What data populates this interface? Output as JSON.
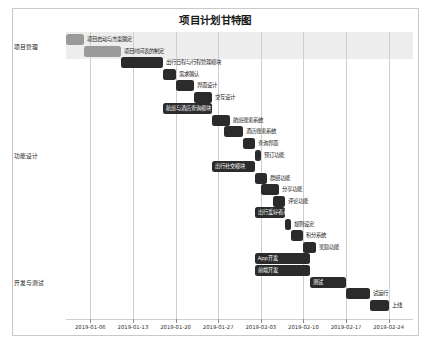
{
  "chart_data": {
    "type": "bar",
    "subtype": "gantt",
    "title": "项目计划甘特图",
    "xlabel": "",
    "ylabel": "",
    "grid": true,
    "legend": false,
    "x_axis": {
      "type": "date",
      "range": [
        "2019-01-02",
        "2019-02-28"
      ],
      "tick_labels": [
        "2019-01-06",
        "2019-01-13",
        "2019-01-20",
        "2019-01-27",
        "2019-02-03",
        "2019-02-10",
        "2019-02-17",
        "2019-02-24"
      ]
    },
    "categories": [
      {
        "label": "项目管理",
        "shaded": true
      },
      {
        "label": "功能设计",
        "shaded": false
      },
      {
        "label": "开发与测试",
        "shaded": false
      }
    ],
    "tasks": [
      {
        "name": "项目启动与方案确定",
        "category": "项目管理",
        "start": "2019-01-02",
        "end": "2019-01-05",
        "color": "#9a9a9a",
        "label_position": "right"
      },
      {
        "name": "项目时间表的制定",
        "category": "项目管理",
        "start": "2019-01-05",
        "end": "2019-01-11",
        "color": "#9a9a9a",
        "label_position": "right"
      },
      {
        "name": "出行日程与行程管理模块",
        "category": "功能设计",
        "start": "2019-01-11",
        "end": "2019-01-18",
        "color": "#2b2b2b",
        "label_position": "right"
      },
      {
        "name": "需求确认",
        "category": "功能设计",
        "start": "2019-01-18",
        "end": "2019-01-20",
        "color": "#2b2b2b",
        "label_position": "right"
      },
      {
        "name": "界面设计",
        "category": "功能设计",
        "start": "2019-01-20",
        "end": "2019-01-23",
        "color": "#2b2b2b",
        "label_position": "right"
      },
      {
        "name": "交互设计",
        "category": "功能设计",
        "start": "2019-01-23",
        "end": "2019-01-26",
        "color": "#2b2b2b",
        "label_position": "right"
      },
      {
        "name": "航班与酒店查询模块",
        "category": "功能设计",
        "start": "2019-01-18",
        "end": "2019-01-26",
        "color": "#2b2b2b",
        "label_position": "inside"
      },
      {
        "name": "航班搜索系统",
        "category": "功能设计",
        "start": "2019-01-26",
        "end": "2019-01-29",
        "color": "#2b2b2b",
        "label_position": "right"
      },
      {
        "name": "酒店搜索系统",
        "category": "功能设计",
        "start": "2019-01-28",
        "end": "2019-01-31",
        "color": "#2b2b2b",
        "label_position": "right"
      },
      {
        "name": "查询界面",
        "category": "功能设计",
        "start": "2019-01-31",
        "end": "2019-02-02",
        "color": "#2b2b2b",
        "label_position": "right"
      },
      {
        "name": "预订功能",
        "category": "功能设计",
        "start": "2019-02-02",
        "end": "2019-02-03",
        "color": "#2b2b2b",
        "label_position": "right"
      },
      {
        "name": "出行社交模块",
        "category": "功能设计",
        "start": "2019-01-26",
        "end": "2019-02-02",
        "color": "#2b2b2b",
        "label_position": "inside"
      },
      {
        "name": "群组功能",
        "category": "功能设计",
        "start": "2019-02-02",
        "end": "2019-02-04",
        "color": "#2b2b2b",
        "label_position": "right"
      },
      {
        "name": "分享功能",
        "category": "功能设计",
        "start": "2019-02-03",
        "end": "2019-02-06",
        "color": "#2b2b2b",
        "label_position": "right"
      },
      {
        "name": "评论功能",
        "category": "功能设计",
        "start": "2019-02-05",
        "end": "2019-02-07",
        "color": "#2b2b2b",
        "label_position": "right"
      },
      {
        "name": "出行爱好者系统",
        "category": "功能设计",
        "start": "2019-02-02",
        "end": "2019-02-07",
        "color": "#2b2b2b",
        "label_position": "inside"
      },
      {
        "name": "规则设定",
        "category": "功能设计",
        "start": "2019-02-07",
        "end": "2019-02-08",
        "color": "#2b2b2b",
        "label_position": "right"
      },
      {
        "name": "积分系统",
        "category": "功能设计",
        "start": "2019-02-08",
        "end": "2019-02-10",
        "color": "#2b2b2b",
        "label_position": "right"
      },
      {
        "name": "奖励功能",
        "category": "功能设计",
        "start": "2019-02-10",
        "end": "2019-02-12",
        "color": "#2b2b2b",
        "label_position": "right"
      },
      {
        "name": "App开发",
        "category": "开发与测试",
        "start": "2019-02-02",
        "end": "2019-02-11",
        "color": "#2b2b2b",
        "label_position": "inside"
      },
      {
        "name": "前端开发",
        "category": "开发与测试",
        "start": "2019-02-02",
        "end": "2019-02-11",
        "color": "#2b2b2b",
        "label_position": "inside"
      },
      {
        "name": "测试",
        "category": "开发与测试",
        "start": "2019-02-11",
        "end": "2019-02-17",
        "color": "#2b2b2b",
        "label_position": "inside"
      },
      {
        "name": "试运行",
        "category": "开发与测试",
        "start": "2019-02-17",
        "end": "2019-02-21",
        "color": "#2b2b2b",
        "label_position": "right"
      },
      {
        "name": "上线",
        "category": "开发与测试",
        "start": "2019-02-21",
        "end": "2019-02-24",
        "color": "#2b2b2b",
        "label_position": "right"
      }
    ]
  }
}
